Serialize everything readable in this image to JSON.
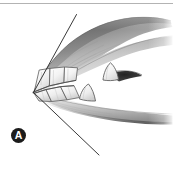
{
  "figure": {
    "panel_label": "A",
    "caption": "",
    "background_color": "#ffffff",
    "ink_color": "#4a4a4a",
    "badge_color": "#1b1b1b",
    "badge_text_color": "#ffffff",
    "rule_color": "#b3b3b3",
    "medium": "graphite pencil illustration"
  },
  "divider": {
    "name": "top-horizontal-rule",
    "y": 3,
    "color": "#b3b3b3"
  },
  "illustration": {
    "title": "",
    "parts": [
      {
        "name": "upper-jaw",
        "label": "Upper jaw / maxilla",
        "shade": "#9a9a9a"
      },
      {
        "name": "lower-jaw",
        "label": "Lower jaw / mandible",
        "shade": "#a8a8a8"
      },
      {
        "name": "upper-incisors",
        "label": "Upper incisors",
        "shade": "#f4f4f4"
      },
      {
        "name": "lower-incisors",
        "label": "Lower incisors",
        "shade": "#f4f4f4"
      },
      {
        "name": "upper-canine",
        "label": "Upper canine tooth",
        "shade": "#f6f6f6"
      },
      {
        "name": "lower-canine",
        "label": "Lower canine tooth",
        "shade": "#f6f6f6"
      },
      {
        "name": "oral-cavity-shadow",
        "label": "Oral cavity shadow",
        "shade": "#3a3a3a"
      }
    ],
    "angle_lines": [
      {
        "name": "upper-angle-line",
        "x1": 76.5,
        "y1": 14.5,
        "x2": 33.5,
        "y2": 92.5,
        "color": "#2e2e2e"
      },
      {
        "name": "lower-angle-line",
        "x1": 33.5,
        "y1": 92.5,
        "x2": 99.0,
        "y2": 155.0,
        "color": "#2e2e2e"
      }
    ],
    "vertex": {
      "name": "angle-vertex",
      "x": 33.5,
      "y": 92.5
    }
  }
}
